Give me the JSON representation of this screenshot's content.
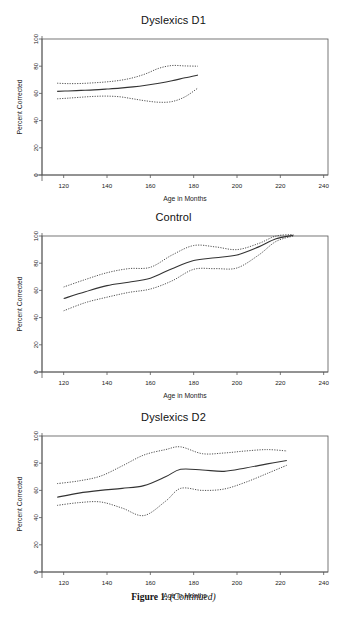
{
  "figure": {
    "caption_bold": "Figure 1.",
    "caption_italic": "(Continued)"
  },
  "axes": {
    "xlabel": "Age in Months",
    "ylabel": "Percent Corrected",
    "xticks": [
      120,
      140,
      160,
      180,
      200,
      220,
      240
    ],
    "yticks": [
      0,
      20,
      40,
      60,
      80,
      100
    ],
    "xlim": [
      110,
      242
    ],
    "ylim": [
      0,
      100
    ],
    "line_color": "#333333",
    "box_color": "#555555"
  },
  "panels": [
    {
      "title": "Dyslexics D1",
      "key": "d1"
    },
    {
      "title": "Control",
      "key": "control"
    },
    {
      "title": "Dyslexics D2",
      "key": "d2"
    }
  ],
  "chart_data": [
    {
      "type": "line",
      "title": "Dyslexics D1",
      "xlabel": "Age in Months",
      "ylabel": "Percent Corrected",
      "xlim": [
        110,
        242
      ],
      "ylim": [
        0,
        100
      ],
      "xticks": [
        120,
        140,
        160,
        180,
        200,
        220,
        240
      ],
      "yticks": [
        0,
        20,
        40,
        60,
        80,
        100
      ],
      "grid": false,
      "legend": "none",
      "series": [
        {
          "name": "fitted mean",
          "style": "solid",
          "x": [
            117,
            122,
            128,
            134,
            140,
            146,
            152,
            158,
            164,
            170,
            176,
            182
          ],
          "values": [
            61.5,
            61.8,
            62.2,
            62.6,
            63.2,
            63.9,
            64.8,
            66.0,
            67.5,
            69.3,
            71.5,
            73.5
          ]
        },
        {
          "name": "upper confidence band",
          "style": "dotted",
          "x": [
            117,
            122,
            128,
            134,
            140,
            146,
            152,
            158,
            164,
            170,
            176,
            182
          ],
          "values": [
            67.5,
            67.2,
            67.3,
            67.8,
            68.5,
            69.6,
            71.5,
            74.5,
            78.5,
            80.5,
            80.2,
            80.0
          ]
        },
        {
          "name": "lower confidence band",
          "style": "dotted",
          "x": [
            117,
            122,
            128,
            134,
            140,
            146,
            152,
            158,
            164,
            170,
            176,
            182
          ],
          "values": [
            56.0,
            56.5,
            57.2,
            57.8,
            58.0,
            57.5,
            56.0,
            54.5,
            53.5,
            54.0,
            57.5,
            64.0
          ]
        }
      ]
    },
    {
      "type": "line",
      "title": "Control",
      "xlabel": "Age in Months",
      "ylabel": "Percent Corrected",
      "xlim": [
        110,
        242
      ],
      "ylim": [
        0,
        100
      ],
      "xticks": [
        120,
        140,
        160,
        180,
        200,
        220,
        240
      ],
      "yticks": [
        0,
        20,
        40,
        60,
        80,
        100
      ],
      "grid": false,
      "legend": "none",
      "series": [
        {
          "name": "fitted mean",
          "style": "solid",
          "x": [
            120,
            130,
            140,
            150,
            160,
            170,
            180,
            190,
            200,
            210,
            218,
            226
          ],
          "values": [
            54.0,
            59.0,
            63.5,
            66.0,
            69.0,
            76.0,
            82.0,
            84.0,
            86.0,
            92.0,
            98.0,
            100.5
          ]
        },
        {
          "name": "upper confidence band",
          "style": "dotted",
          "x": [
            120,
            130,
            140,
            150,
            160,
            170,
            180,
            190,
            200,
            210,
            218,
            226
          ],
          "values": [
            62.5,
            68.0,
            73.0,
            76.0,
            77.0,
            86.0,
            93.0,
            92.0,
            90.0,
            94.5,
            100.0,
            101.0
          ]
        },
        {
          "name": "lower confidence band",
          "style": "dotted",
          "x": [
            120,
            130,
            140,
            150,
            160,
            170,
            180,
            190,
            200,
            210,
            218,
            226
          ],
          "values": [
            45.0,
            51.0,
            55.0,
            58.5,
            61.0,
            67.0,
            75.5,
            76.0,
            76.5,
            86.0,
            96.0,
            100.0
          ]
        }
      ]
    },
    {
      "type": "line",
      "title": "Dyslexics D2",
      "xlabel": "Age in Months",
      "ylabel": "Percent Corrected",
      "xlim": [
        110,
        242
      ],
      "ylim": [
        0,
        100
      ],
      "xticks": [
        120,
        140,
        160,
        180,
        200,
        220,
        240
      ],
      "yticks": [
        0,
        20,
        40,
        60,
        80,
        100
      ],
      "grid": false,
      "legend": "none",
      "series": [
        {
          "name": "fitted mean",
          "style": "solid",
          "x": [
            117,
            127,
            137,
            147,
            157,
            167,
            174,
            184,
            194,
            204,
            214,
            223
          ],
          "values": [
            55.0,
            58.0,
            60.0,
            61.5,
            63.5,
            70.0,
            75.5,
            75.0,
            74.0,
            76.5,
            79.5,
            82.0
          ]
        },
        {
          "name": "upper confidence band",
          "style": "dotted",
          "x": [
            117,
            127,
            137,
            147,
            157,
            167,
            174,
            184,
            194,
            204,
            214,
            223
          ],
          "values": [
            65.0,
            67.0,
            70.5,
            78.0,
            86.0,
            90.0,
            92.0,
            87.0,
            87.5,
            89.0,
            90.0,
            89.0
          ]
        },
        {
          "name": "lower confidence band",
          "style": "dotted",
          "x": [
            117,
            127,
            137,
            147,
            157,
            167,
            174,
            184,
            194,
            204,
            214,
            223
          ],
          "values": [
            49.0,
            51.0,
            51.5,
            47.0,
            41.5,
            52.0,
            61.5,
            60.0,
            61.0,
            66.0,
            72.5,
            78.5
          ]
        }
      ]
    }
  ]
}
